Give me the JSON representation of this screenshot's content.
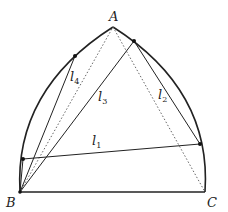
{
  "diagram": {
    "type": "reuleaux-triangle-geometry",
    "colors": {
      "stroke": "#222222",
      "dotted": "#555555",
      "background": "#ffffff"
    },
    "points": {
      "A": {
        "label": "A",
        "x": 113,
        "y": 27
      },
      "B": {
        "label": "B",
        "x": 20,
        "y": 192
      },
      "C": {
        "label": "C",
        "x": 205,
        "y": 192
      },
      "P_right_top": {
        "x": 134,
        "y": 41
      },
      "P_left_top": {
        "x": 75,
        "y": 56
      },
      "P_left_low": {
        "x": 23,
        "y": 159
      },
      "P_right_low": {
        "x": 200,
        "y": 144
      }
    },
    "lines": [
      {
        "name": "l1",
        "label": "l",
        "sub": "1"
      },
      {
        "name": "l2",
        "label": "l",
        "sub": "2"
      },
      {
        "name": "l3",
        "label": "l",
        "sub": "3"
      },
      {
        "name": "l4",
        "label": "l",
        "sub": "4"
      }
    ],
    "vertex_labels": {
      "A": "A",
      "B": "B",
      "C": "C"
    }
  }
}
